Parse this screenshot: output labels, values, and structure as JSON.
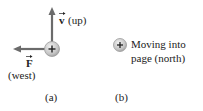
{
  "panel_a": {
    "velocity_symbol": "v",
    "velocity_dir": "(up)",
    "force_symbol": "F",
    "force_dir": "(west)",
    "charge_sign": "+",
    "caption": "(a)"
  },
  "panel_b": {
    "charge_sign": "+",
    "line1": "Moving into",
    "line2": "page (north)",
    "caption": "(b)"
  },
  "colors": {
    "arrow": "#6b6b6b",
    "charge_fill": "#c8c8c8",
    "charge_edge": "#9a9a9a"
  }
}
